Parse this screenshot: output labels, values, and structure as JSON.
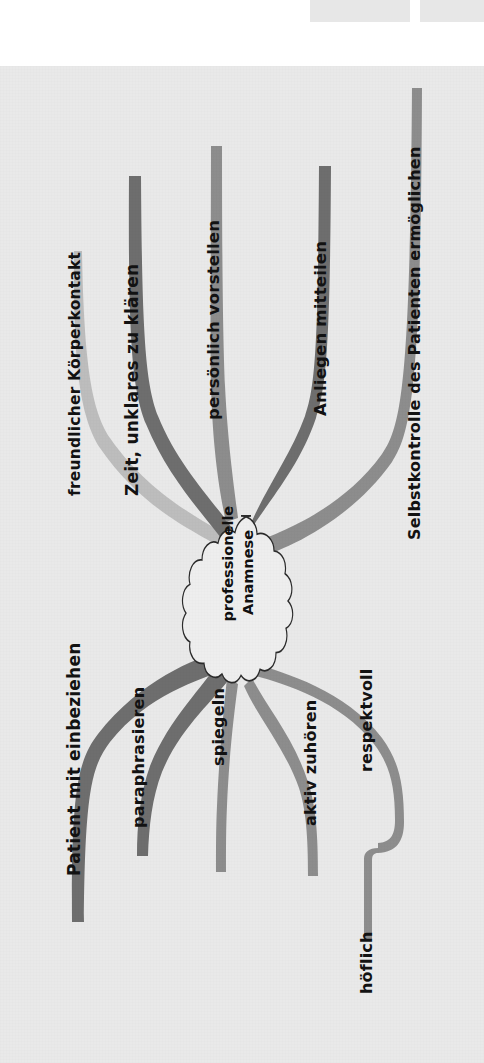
{
  "figure": {
    "type": "mind-map",
    "orientation": "rotated-90-ccw",
    "center_label_line1": "professionelle",
    "center_label_line2": "Anamnese",
    "center_label": "professionelle Anamnese",
    "colors": {
      "page_background": "#e9e9e9",
      "outer_background": "#ffffff",
      "branch_dark": "#6e6e6e",
      "branch_mid": "#8d8d8d",
      "branch_light": "#b3b3b3",
      "branch_lighter": "#bdbdbd",
      "text": "#121212",
      "cloud_fill": "#eeeeee",
      "cloud_stroke": "#2b2b2b",
      "top_block": "#e7e7e7"
    },
    "top_blocks": [
      {
        "name": "top-block-left"
      },
      {
        "name": "top-block-right"
      }
    ],
    "branches": [
      {
        "id": "freundlicher-koerperkontakt",
        "label": "freundlicher Körperkontakt",
        "side": "upper",
        "tone": "light"
      },
      {
        "id": "zeit-unklares-zu-klaeren",
        "label": "Zeit, unklares zu klären",
        "side": "upper",
        "tone": "dark"
      },
      {
        "id": "persoenlich-vorstellen",
        "label": "persönlich vorstellen",
        "side": "upper",
        "tone": "mid"
      },
      {
        "id": "anliegen-mitteilen",
        "label": "Anliegen mitteilen",
        "side": "upper",
        "tone": "dark"
      },
      {
        "id": "selbstkontrolle-des-patienten-ermoeglichen",
        "label": "Selbstkontrolle des Patienten ermöglichen",
        "side": "upper",
        "tone": "mid"
      },
      {
        "id": "patient-mit-einbeziehen",
        "label": "Patient mit einbeziehen",
        "side": "lower",
        "tone": "dark"
      },
      {
        "id": "paraphrasieren",
        "label": "paraphrasieren",
        "side": "lower",
        "tone": "dark"
      },
      {
        "id": "spiegeln",
        "label": "spiegeln",
        "side": "lower",
        "tone": "mid"
      },
      {
        "id": "aktiv-zuhoeren",
        "label": "aktiv zuhören",
        "side": "lower",
        "tone": "mid"
      },
      {
        "id": "respektvoll",
        "label": "respektvoll",
        "side": "lower",
        "tone": "mid"
      },
      {
        "id": "hoeflich",
        "label": "höflich",
        "side": "lower",
        "tone": "mid",
        "parent": "respektvoll"
      }
    ]
  }
}
